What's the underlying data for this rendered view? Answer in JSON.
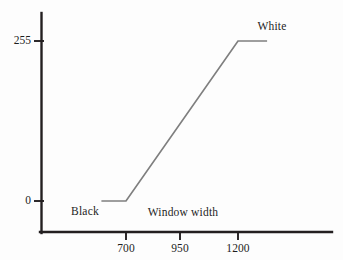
{
  "chart_data": {
    "type": "line",
    "title": "",
    "subtitle": "",
    "xlabel": "Window width",
    "ylabel": "",
    "xlim": [
      575,
      1400
    ],
    "ylim": [
      0,
      300
    ],
    "grid": false,
    "legend_position": "none",
    "x_ticks": [
      {
        "value": 700,
        "label": "700"
      },
      {
        "value": 950,
        "label": "950"
      },
      {
        "value": 1200,
        "label": "1200"
      }
    ],
    "y_ticks": [
      {
        "value": 0,
        "label": "0"
      },
      {
        "value": 255,
        "label": "255"
      }
    ],
    "series": [
      {
        "name": "window-transfer-function",
        "color": "#7f7f7f",
        "x": [
          590,
          700,
          1200,
          1330
        ],
        "values": [
          0,
          0,
          255,
          255
        ]
      }
    ],
    "annotations": [
      {
        "id": "black-label",
        "text": "Black",
        "x": 620,
        "y": 0
      },
      {
        "id": "white-label",
        "text": "White",
        "x": 1280,
        "y": 255
      },
      {
        "id": "window-width-label",
        "text": "Window width",
        "x": 950,
        "y": 0
      }
    ]
  },
  "axes": {
    "y_tick_255": "255",
    "y_tick_0": "0",
    "x_tick_700": "700",
    "x_tick_950": "950",
    "x_tick_1200": "1200"
  },
  "labels": {
    "black": "Black",
    "white": "White",
    "window_width": "Window width"
  },
  "colors": {
    "axis": "#231f20",
    "data_line": "#7f7f7f",
    "text": "#1d1d1d",
    "background": "#fdfdfd"
  }
}
